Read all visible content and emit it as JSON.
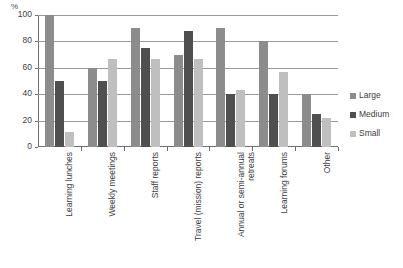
{
  "chart_data": {
    "type": "bar",
    "title": "",
    "xlabel": "",
    "ylabel": "%",
    "ylim": [
      0,
      100
    ],
    "yticks": [
      0,
      20,
      40,
      60,
      80,
      100
    ],
    "grid": true,
    "legend_position": "right",
    "categories": [
      "Learning lunches",
      "Weekly meetings",
      "Staff reports",
      "Travel (mission) reports",
      "Annual or semi-annual retreats",
      "Learning forums",
      "Other"
    ],
    "series": [
      {
        "name": "Large",
        "color": "#8c8c8c",
        "values": [
          100,
          60,
          90,
          70,
          90,
          80,
          40
        ]
      },
      {
        "name": "Medium",
        "color": "#4f4f4f",
        "values": [
          50,
          50,
          75,
          88,
          40,
          40,
          25
        ]
      },
      {
        "name": "Small",
        "color": "#bfbfbf",
        "values": [
          11,
          67,
          67,
          67,
          43,
          57,
          22
        ]
      }
    ]
  },
  "caption": {
    "text": ""
  }
}
